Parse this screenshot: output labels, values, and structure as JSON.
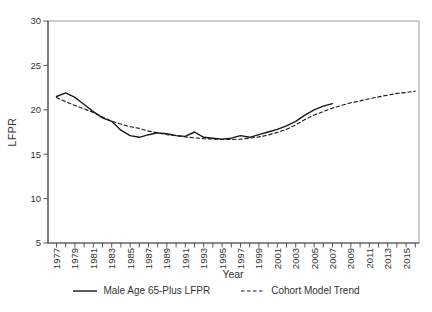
{
  "figure": {
    "y_axis_title": "LFPR",
    "x_axis_title": "Year",
    "background": "#ffffff"
  },
  "colors": {
    "series_line": "#1a1a1a",
    "axis_dark": "#4a4a4a",
    "box_light": "#9a9a9a",
    "tick": "#555555",
    "text": "#333333"
  },
  "legend": {
    "items": [
      {
        "id": "male-lfpr",
        "label": "Male Age 65-Plus LFPR",
        "style": "solid"
      },
      {
        "id": "cohort-trend",
        "label": "Cohort Model Trend",
        "style": "dashed"
      }
    ]
  },
  "chart_data": {
    "type": "line",
    "title": "",
    "xlabel": "Year",
    "ylabel": "LFPR",
    "ylim": [
      5,
      30
    ],
    "yticks": [
      5,
      10,
      15,
      20,
      25,
      30
    ],
    "x_range": [
      1977,
      2016
    ],
    "xtick_step_minor": 1,
    "xtick_labels": [
      "1977",
      "1979",
      "1981",
      "1983",
      "1985",
      "1987",
      "1989",
      "1991",
      "1993",
      "1995",
      "1997",
      "1999",
      "2001",
      "2003",
      "2005",
      "2007",
      "2009",
      "2011",
      "2013",
      "2015"
    ],
    "grid": false,
    "legend_position": "bottom",
    "series": [
      {
        "name": "Male Age 65-Plus LFPR",
        "style": "solid",
        "x_start": 1977,
        "values": [
          21.5,
          21.9,
          21.4,
          20.6,
          19.8,
          19.1,
          18.7,
          17.7,
          17.1,
          16.9,
          17.2,
          17.4,
          17.3,
          17.1,
          17.0,
          17.5,
          16.9,
          16.8,
          16.7,
          16.8,
          17.1,
          16.9,
          17.2,
          17.5,
          17.8,
          18.2,
          18.7,
          19.4,
          20.0,
          20.4,
          20.7
        ]
      },
      {
        "name": "Cohort Model Trend",
        "style": "dashed",
        "x_start": 1977,
        "values": [
          21.4,
          20.9,
          20.5,
          20.1,
          19.7,
          19.2,
          18.7,
          18.4,
          18.1,
          17.9,
          17.6,
          17.4,
          17.2,
          17.1,
          16.95,
          16.85,
          16.75,
          16.7,
          16.65,
          16.65,
          16.7,
          16.8,
          16.95,
          17.15,
          17.45,
          17.8,
          18.3,
          18.9,
          19.4,
          19.8,
          20.2,
          20.5,
          20.8,
          21.0,
          21.25,
          21.45,
          21.65,
          21.85,
          21.95,
          22.1
        ]
      }
    ]
  }
}
